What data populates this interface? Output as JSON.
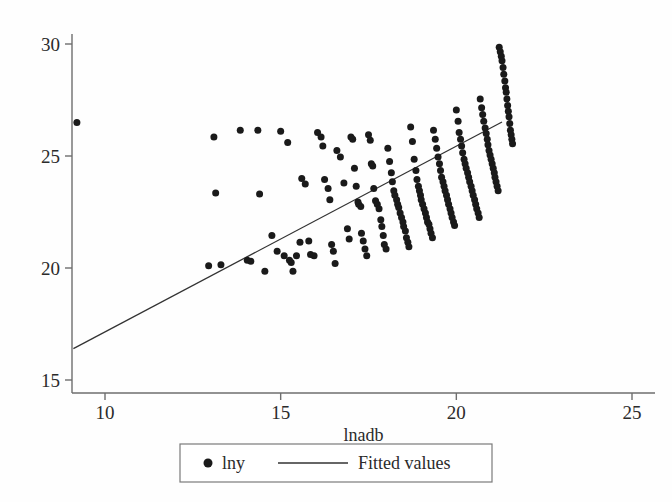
{
  "figure": {
    "background": "#fefefe",
    "ink": "#1a1a1a",
    "axis_color": "#6e6e6e"
  },
  "axes": {
    "x_title": "lnadb",
    "y_title": "",
    "x_ticks": [
      "10",
      "15",
      "20",
      "25"
    ],
    "y_ticks": [
      "15",
      "20",
      "25",
      "30"
    ]
  },
  "legend": {
    "marker_glyph": "●",
    "entries": [
      {
        "label": "lny",
        "kind": "marker"
      },
      {
        "label": "Fitted values",
        "kind": "line"
      }
    ]
  },
  "chart_data": {
    "type": "scatter",
    "title": "",
    "xlabel": "lnadb",
    "ylabel": "lny",
    "xlim": [
      9.0,
      25.5
    ],
    "ylim": [
      14.6,
      30.4
    ],
    "xticks": [
      10,
      15,
      20,
      25
    ],
    "yticks": [
      15,
      20,
      25,
      30
    ],
    "grid": false,
    "legend_position": "below-axes",
    "series": [
      {
        "name": "lny",
        "kind": "scatter",
        "marker": "filled-circle",
        "marker_size_px": 7,
        "color": "#1a1a1a",
        "points": [
          [
            9.2,
            26.5
          ],
          [
            12.95,
            20.1
          ],
          [
            13.3,
            20.15
          ],
          [
            13.15,
            23.35
          ],
          [
            13.1,
            25.85
          ],
          [
            13.85,
            26.15
          ],
          [
            14.35,
            26.15
          ],
          [
            14.4,
            23.3
          ],
          [
            14.05,
            20.35
          ],
          [
            14.15,
            20.3
          ],
          [
            14.55,
            19.85
          ],
          [
            14.75,
            21.45
          ],
          [
            14.9,
            20.75
          ],
          [
            15.0,
            26.1
          ],
          [
            15.2,
            25.6
          ],
          [
            15.1,
            20.55
          ],
          [
            15.25,
            20.35
          ],
          [
            15.3,
            20.25
          ],
          [
            15.35,
            19.85
          ],
          [
            15.45,
            20.55
          ],
          [
            15.55,
            21.15
          ],
          [
            15.6,
            24.0
          ],
          [
            15.7,
            23.75
          ],
          [
            15.8,
            21.2
          ],
          [
            15.85,
            20.6
          ],
          [
            15.95,
            20.55
          ],
          [
            16.05,
            26.05
          ],
          [
            16.15,
            25.85
          ],
          [
            16.2,
            25.45
          ],
          [
            16.25,
            23.95
          ],
          [
            16.35,
            23.55
          ],
          [
            16.4,
            23.05
          ],
          [
            16.45,
            21.05
          ],
          [
            16.5,
            20.75
          ],
          [
            16.55,
            20.2
          ],
          [
            16.6,
            25.25
          ],
          [
            16.7,
            24.95
          ],
          [
            16.8,
            23.8
          ],
          [
            16.9,
            21.75
          ],
          [
            16.95,
            21.3
          ],
          [
            17.0,
            25.85
          ],
          [
            17.05,
            25.75
          ],
          [
            17.1,
            24.45
          ],
          [
            17.15,
            23.65
          ],
          [
            17.2,
            22.95
          ],
          [
            17.22,
            22.85
          ],
          [
            17.28,
            22.75
          ],
          [
            17.3,
            21.55
          ],
          [
            17.35,
            21.2
          ],
          [
            17.4,
            20.85
          ],
          [
            17.45,
            20.55
          ],
          [
            17.5,
            25.95
          ],
          [
            17.55,
            25.7
          ],
          [
            17.58,
            24.65
          ],
          [
            17.62,
            24.55
          ],
          [
            17.65,
            23.55
          ],
          [
            17.7,
            23.0
          ],
          [
            17.75,
            22.85
          ],
          [
            17.8,
            22.65
          ],
          [
            17.85,
            22.15
          ],
          [
            17.88,
            21.85
          ],
          [
            17.92,
            21.45
          ],
          [
            17.95,
            21.05
          ],
          [
            18.0,
            20.85
          ],
          [
            18.05,
            25.35
          ],
          [
            18.1,
            24.75
          ],
          [
            18.15,
            24.25
          ],
          [
            18.18,
            23.85
          ],
          [
            18.22,
            23.45
          ],
          [
            18.25,
            23.25
          ],
          [
            18.3,
            23.05
          ],
          [
            18.33,
            22.85
          ],
          [
            18.36,
            22.7
          ],
          [
            18.4,
            22.45
          ],
          [
            18.44,
            22.25
          ],
          [
            18.48,
            22.05
          ],
          [
            18.5,
            21.85
          ],
          [
            18.55,
            21.65
          ],
          [
            18.58,
            21.35
          ],
          [
            18.62,
            21.15
          ],
          [
            18.65,
            20.95
          ],
          [
            18.7,
            26.3
          ],
          [
            18.75,
            25.65
          ],
          [
            18.8,
            24.85
          ],
          [
            18.85,
            24.35
          ],
          [
            18.88,
            23.95
          ],
          [
            18.92,
            23.65
          ],
          [
            18.95,
            23.45
          ],
          [
            18.98,
            23.25
          ],
          [
            19.0,
            23.05
          ],
          [
            19.04,
            22.85
          ],
          [
            19.08,
            22.65
          ],
          [
            19.12,
            22.45
          ],
          [
            19.15,
            22.25
          ],
          [
            19.18,
            22.05
          ],
          [
            19.22,
            21.95
          ],
          [
            19.25,
            21.75
          ],
          [
            19.28,
            21.55
          ],
          [
            19.32,
            21.35
          ],
          [
            19.35,
            26.15
          ],
          [
            19.4,
            25.75
          ],
          [
            19.44,
            25.35
          ],
          [
            19.48,
            24.95
          ],
          [
            19.52,
            24.65
          ],
          [
            19.55,
            24.35
          ],
          [
            19.58,
            24.05
          ],
          [
            19.62,
            23.85
          ],
          [
            19.65,
            23.65
          ],
          [
            19.68,
            23.45
          ],
          [
            19.72,
            23.25
          ],
          [
            19.75,
            23.05
          ],
          [
            19.78,
            22.85
          ],
          [
            19.82,
            22.65
          ],
          [
            19.85,
            22.45
          ],
          [
            19.88,
            22.25
          ],
          [
            19.92,
            22.05
          ],
          [
            19.95,
            21.9
          ],
          [
            20.0,
            27.05
          ],
          [
            20.05,
            26.55
          ],
          [
            20.08,
            26.05
          ],
          [
            20.12,
            25.75
          ],
          [
            20.15,
            25.45
          ],
          [
            20.18,
            25.15
          ],
          [
            20.22,
            24.85
          ],
          [
            20.25,
            24.65
          ],
          [
            20.28,
            24.45
          ],
          [
            20.32,
            24.25
          ],
          [
            20.35,
            24.05
          ],
          [
            20.38,
            23.85
          ],
          [
            20.42,
            23.65
          ],
          [
            20.45,
            23.45
          ],
          [
            20.48,
            23.25
          ],
          [
            20.52,
            23.05
          ],
          [
            20.55,
            22.85
          ],
          [
            20.58,
            22.65
          ],
          [
            20.62,
            22.45
          ],
          [
            20.65,
            22.25
          ],
          [
            20.68,
            27.55
          ],
          [
            20.72,
            27.15
          ],
          [
            20.75,
            26.85
          ],
          [
            20.78,
            26.55
          ],
          [
            20.82,
            26.25
          ],
          [
            20.85,
            26.0
          ],
          [
            20.88,
            25.75
          ],
          [
            20.9,
            25.5
          ],
          [
            20.93,
            25.25
          ],
          [
            20.96,
            25.05
          ],
          [
            20.99,
            24.85
          ],
          [
            21.02,
            24.65
          ],
          [
            21.05,
            24.45
          ],
          [
            21.08,
            24.25
          ],
          [
            21.1,
            24.05
          ],
          [
            21.13,
            23.85
          ],
          [
            21.16,
            23.65
          ],
          [
            21.19,
            23.45
          ],
          [
            21.22,
            29.85
          ],
          [
            21.25,
            29.65
          ],
          [
            21.28,
            29.45
          ],
          [
            21.3,
            29.25
          ],
          [
            21.33,
            28.95
          ],
          [
            21.35,
            28.65
          ],
          [
            21.38,
            28.35
          ],
          [
            21.4,
            28.05
          ],
          [
            21.42,
            27.85
          ],
          [
            21.44,
            27.55
          ],
          [
            21.46,
            27.25
          ],
          [
            21.48,
            27.0
          ],
          [
            21.5,
            26.75
          ],
          [
            21.52,
            26.45
          ],
          [
            21.54,
            26.15
          ],
          [
            21.56,
            25.95
          ],
          [
            21.58,
            25.75
          ],
          [
            21.6,
            25.55
          ]
        ]
      },
      {
        "name": "Fitted values",
        "kind": "line",
        "color": "#333333",
        "x": [
          9.1,
          21.3
        ],
        "y": [
          16.4,
          26.52
        ],
        "slope": 0.83,
        "intercept": 8.85
      }
    ]
  }
}
